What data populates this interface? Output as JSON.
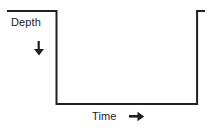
{
  "figure": {
    "title": "",
    "background_color": "#ffffff",
    "line_color": "#231f20",
    "text_color": "#1a1a1a",
    "line_width": 2
  },
  "axes": {
    "vertical": {
      "label": "Depth",
      "direction_icon": "arrow-down-icon",
      "direction": "down"
    },
    "horizontal": {
      "label": "Time",
      "direction_icon": "arrow-right-icon",
      "direction": "right"
    }
  },
  "chart_data": {
    "type": "line",
    "title": "",
    "xlabel": "Time",
    "ylabel": "Depth",
    "grid": false,
    "legend": null,
    "axis_ticks": {
      "x": [],
      "y": []
    },
    "axis_direction": {
      "x": "right",
      "y": "down"
    },
    "series": [
      {
        "name": "Depth profile",
        "x": [
          0,
          25,
          25,
          96,
          96,
          100
        ],
        "y": [
          0,
          0,
          100,
          100,
          0,
          0
        ],
        "points": [
          {
            "x": 0,
            "y": 0,
            "note": "surface start"
          },
          {
            "x": 25,
            "y": 0,
            "note": "start of descent"
          },
          {
            "x": 25,
            "y": 100,
            "note": "bottom reached"
          },
          {
            "x": 96,
            "y": 100,
            "note": "end of bottom phase"
          },
          {
            "x": 96,
            "y": 0,
            "note": "ascent to surface"
          },
          {
            "x": 100,
            "y": 0,
            "note": "surface end"
          }
        ]
      }
    ],
    "xlim": [
      0,
      100
    ],
    "ylim": [
      100,
      0
    ]
  }
}
